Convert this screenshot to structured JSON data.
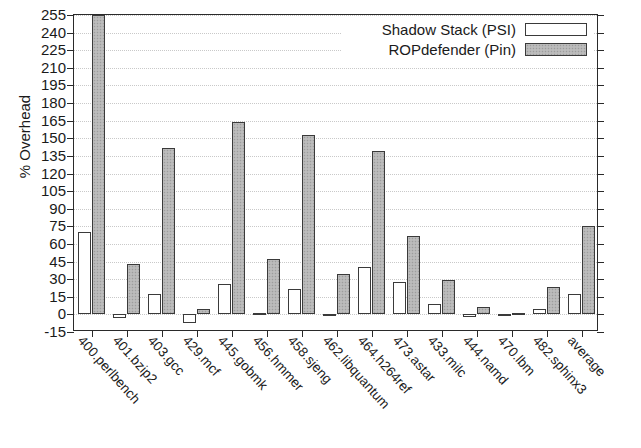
{
  "chart_data": {
    "type": "bar",
    "title": "",
    "xlabel": "",
    "ylabel": "% Overhead",
    "ylim": [
      -15,
      255
    ],
    "ytick_step": 15,
    "yticks": [
      255,
      240,
      225,
      210,
      195,
      180,
      165,
      150,
      135,
      120,
      105,
      90,
      75,
      60,
      45,
      30,
      15,
      0,
      -15
    ],
    "ytick_labels": [
      "255",
      "240",
      "225",
      "210",
      "195",
      "180",
      "165",
      "150",
      "135",
      "120",
      "105",
      "90",
      "75",
      "60",
      "45",
      "30",
      "15",
      "0",
      "-15"
    ],
    "grid": true,
    "legend_position": "top-right",
    "categories": [
      "400.perlbench",
      "401.bzip2",
      "403.gcc",
      "429.mcf",
      "445.gobmk",
      "456.hmmer",
      "458.sjeng",
      "462.libquantum",
      "464.h264ref",
      "473.astar",
      "433.milc",
      "444.namd",
      "470.lbm",
      "482.sphinx3",
      "average"
    ],
    "series": [
      {
        "name": "Shadow Stack (PSI)",
        "fill": "#ffffff",
        "values": [
          70,
          -3,
          17,
          -7,
          26,
          1,
          22,
          -1,
          40,
          28,
          9,
          -2,
          -1,
          5,
          17
        ]
      },
      {
        "name": "ROPdefender (Pin)",
        "fill": "#b6b6b6",
        "values": [
          255,
          43,
          142,
          5,
          164,
          47,
          153,
          34,
          139,
          67,
          29,
          6,
          1,
          23,
          75
        ]
      }
    ]
  },
  "legend": {
    "entries": [
      {
        "label": "Shadow Stack (PSI)",
        "style": "psi"
      },
      {
        "label": "ROPdefender (Pin)",
        "style": "pin"
      }
    ]
  },
  "colors": {
    "axis": "#2a2a2a",
    "grid": "#c9c9c9",
    "bar_outline": "#3a3a3a",
    "series_psi": "#ffffff",
    "series_pin": "#b6b6b6"
  }
}
